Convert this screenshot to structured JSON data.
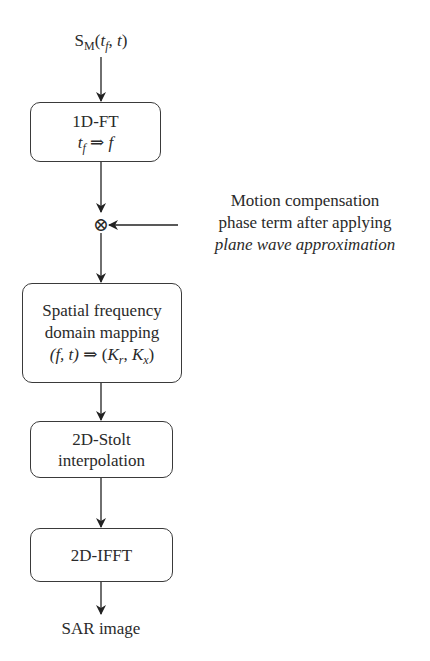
{
  "diagram": {
    "input": {
      "main": "S",
      "sub": "M",
      "open": "(",
      "arg1": "t",
      "arg1_sub": "f",
      "sep": ", ",
      "arg2": "t",
      "close": ")"
    },
    "nodes": [
      {
        "id": "ft",
        "line1": "1D-FT",
        "line2_a": "t",
        "line2_a_sub": "f",
        "line2_arrow": " ⇒ ",
        "line2_b": "f"
      },
      {
        "id": "mult",
        "symbol": "⊗"
      },
      {
        "id": "mapping",
        "line1": "Spatial frequency",
        "line2": "domain mapping",
        "line3_left": "(f, t)",
        "line3_arrow": " ⇒ ",
        "line3_r_open": "(",
        "line3_k1": "K",
        "line3_k1_sub": "r",
        "line3_sep": ", ",
        "line3_k2": "K",
        "line3_k2_sub": "x",
        "line3_r_close": ")"
      },
      {
        "id": "stolt",
        "line1": "2D-Stolt",
        "line2": "interpolation"
      },
      {
        "id": "ifft",
        "line1": "2D-IFFT"
      }
    ],
    "side_input": {
      "line1": "Motion compensation",
      "line2": "phase term after applying",
      "line3": "plane wave approximation"
    },
    "output": {
      "label": "SAR image"
    }
  }
}
